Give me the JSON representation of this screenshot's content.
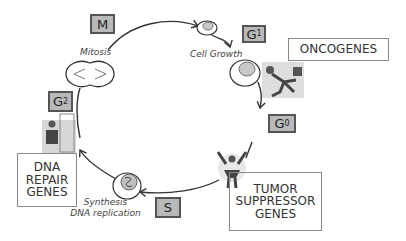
{
  "diagram": {
    "phases": [
      {
        "id": "M",
        "main": "M",
        "sub": "",
        "description": "Mitosis"
      },
      {
        "id": "G1",
        "main": "G",
        "sub": "1",
        "description": "Cell Growth"
      },
      {
        "id": "G0",
        "main": "G",
        "sub": "0",
        "description": ""
      },
      {
        "id": "S",
        "main": "S",
        "sub": "",
        "description": "Synthesis DNA replication"
      },
      {
        "id": "G2",
        "main": "G",
        "sub": "2",
        "description": ""
      }
    ],
    "labels": {
      "mitosis": "Mitosis",
      "cell_growth": "Cell Growth",
      "synthesis_line1": "Synthesis",
      "synthesis_line2": "DNA replication"
    },
    "gene_boxes": {
      "oncogenes": {
        "lines": [
          "ONCOGENES"
        ]
      },
      "tumor_suppressor": {
        "lines": [
          "TUMOR",
          "SUPPRESSOR",
          "GENES"
        ]
      },
      "dna_repair": {
        "lines": [
          "DNA",
          "REPAIR",
          "GENES"
        ]
      }
    },
    "edges": [
      {
        "from": "M",
        "to": "G1"
      },
      {
        "from": "G1",
        "to": "G0"
      },
      {
        "from": "G0",
        "to": "S"
      },
      {
        "from": "S",
        "to": "G2"
      },
      {
        "from": "G2",
        "to": "M"
      }
    ],
    "colors": {
      "phase_box_fill": "#b9b9b9",
      "phase_box_border": "#555555",
      "line": "#333333",
      "cell_nucleus": "#c8c8c8"
    }
  }
}
